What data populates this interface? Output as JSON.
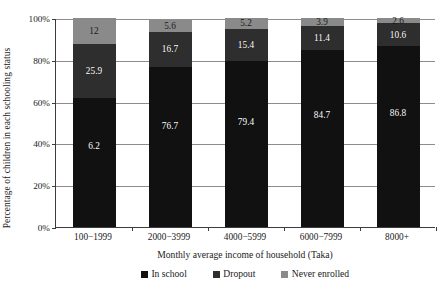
{
  "chart_data": {
    "type": "bar",
    "subtype": "stacked-100-percent",
    "title": "",
    "xlabel": "Monthly average income of household (Taka)",
    "ylabel": "Percentage of  children in each schooling status",
    "categories": [
      "100−1999",
      "2000−3999",
      "4000−5999",
      "6000−7999",
      "8000+"
    ],
    "series": [
      {
        "name": "In school",
        "color": "#111111",
        "values": [
          61.9,
          76.7,
          79.4,
          84.7,
          86.8
        ],
        "labels": [
          "6.2",
          "76.7",
          "79.4",
          "84.7",
          "86.8"
        ]
      },
      {
        "name": "Dropout",
        "color": "#2e2e2e",
        "values": [
          25.9,
          16.7,
          15.4,
          11.4,
          10.6
        ],
        "labels": [
          "25.9",
          "16.7",
          "15.4",
          "11.4",
          "10.6"
        ]
      },
      {
        "name": "Never enrolled",
        "color": "#8a8a8a",
        "values": [
          12.0,
          5.6,
          5.2,
          3.9,
          2.6
        ],
        "labels": [
          "12",
          "5.6",
          "5.2",
          "3.9",
          "2.6"
        ]
      }
    ],
    "yticks": [
      "0%",
      "20%",
      "40%",
      "60%",
      "80%",
      "100%"
    ],
    "ytick_values": [
      0,
      20,
      40,
      60,
      80,
      100
    ],
    "ylim": [
      0,
      100
    ],
    "grid": true,
    "legend_position": "bottom"
  },
  "legend": {
    "items": [
      {
        "label": "In school",
        "color": "#111111"
      },
      {
        "label": "Dropout",
        "color": "#2e2e2e"
      },
      {
        "label": "Never enrolled",
        "color": "#8a8a8a"
      }
    ]
  },
  "colors": {
    "axis": "#3c3c3c",
    "grid": "#8d8d8d",
    "text": "#1a1a1a",
    "label_on_bar": "#ffffff",
    "background": "#ffffff"
  }
}
